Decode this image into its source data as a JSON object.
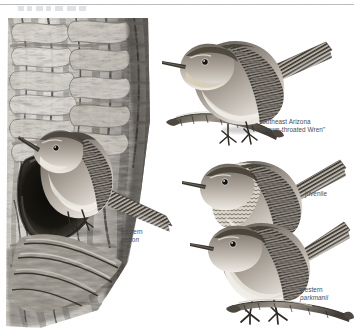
{
  "plate": {
    "kind": "field-guide-illustration",
    "subject": "House Wren",
    "medium": "grayscale painting",
    "background_color": "#ffffff"
  },
  "header": {
    "rule_color": "#b9bcc0",
    "clipped_title_visible": true
  },
  "labels": [
    {
      "id": "eastern-aedon",
      "lines": [
        "eastern",
        "aedon"
      ],
      "italic_lines": [
        false,
        true
      ],
      "color": "#4a4e53",
      "x": 121,
      "y": 228,
      "align": "left"
    },
    {
      "id": "southeast-arizona",
      "lines": [
        "southeast Arizona",
        "\"Brown-throated Wren\""
      ],
      "italic_lines": [
        false,
        false
      ],
      "color": "#4a4e53",
      "x": 259,
      "y": 118,
      "align": "left"
    },
    {
      "id": "juvenile",
      "lines": [
        "juvenile"
      ],
      "italic_lines": [
        false
      ],
      "color": "#4a4e53",
      "x": 305,
      "y": 190,
      "align": "left"
    },
    {
      "id": "western-parkmanii",
      "lines": [
        "western",
        "parkmanii"
      ],
      "italic_lines": [
        false,
        true
      ],
      "color": "#4a4e53",
      "x": 300,
      "y": 286,
      "align": "left"
    }
  ],
  "figures": [
    {
      "id": "tree-trunk-with-nest-cavity",
      "description": "Vertical rough-barked tree trunk occupying the left side with a dark nest cavity; an adult eastern House Wren perches at the cavity entrance.",
      "tone_light": "#e8e6e2",
      "tone_mid": "#9a958e",
      "tone_dark": "#2e2c2a"
    },
    {
      "id": "bird-eastern-aedon",
      "description": "Adult House Wren, eastern subspecies aedon, perched on bark beside nest hole, facing left, tail cocked down-right.",
      "label_ref": "eastern-aedon"
    },
    {
      "id": "bird-southeast-arizona",
      "description": "Adult Brown-throated Wren of southeast Arizona perched on a short twig, facing left, tail raised.",
      "label_ref": "southeast-arizona"
    },
    {
      "id": "bird-juvenile",
      "description": "Juvenile House Wren with heavily scalloped breast, facing left, tail raised.",
      "label_ref": "juvenile"
    },
    {
      "id": "bird-western-parkmanii",
      "description": "Adult House Wren, western subspecies parkmanii, standing on a twig, facing left, tail raised.",
      "label_ref": "western-parkmanii"
    },
    {
      "id": "twig-upper",
      "description": "Short woody twig perch under the southeast Arizona wren."
    },
    {
      "id": "twig-lower",
      "description": "Short woody twig perch under the western parkmanii wren."
    }
  ],
  "palette": {
    "paper": "#ffffff",
    "label_text": "#4a4e53",
    "rule": "#b9bcc0",
    "bark_light": "#e6e4df",
    "bark_mid": "#9d978f",
    "bark_dark": "#26241f",
    "plumage_light": "#ded9d1",
    "plumage_mid": "#8f8a82",
    "plumage_dark": "#36332e",
    "cavity": "#141311"
  }
}
